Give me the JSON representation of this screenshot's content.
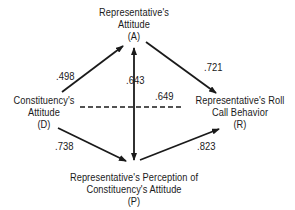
{
  "diagram": {
    "type": "path-diagram",
    "nodes": {
      "A": {
        "line1": "Representative's",
        "line2": "Attitude",
        "line3": "(A)"
      },
      "D": {
        "line1": "Constituency's",
        "line2": "Attitude",
        "line3": "(D)"
      },
      "R": {
        "line1": "Representative's Roll",
        "line2": "Call Behavior",
        "line3": "(R)"
      },
      "P": {
        "line1": "Representative's Perception of",
        "line2": "Constituency's Attitude",
        "line3": "(P)"
      }
    },
    "edges": [
      {
        "from": "D",
        "to": "A",
        "style": "solid",
        "directed": true,
        "coefficient": ".498"
      },
      {
        "from": "P",
        "to": "A",
        "style": "solid",
        "directed": "both",
        "coefficient": ".643"
      },
      {
        "from": "A",
        "to": "R",
        "style": "solid",
        "directed": true,
        "coefficient": ".721"
      },
      {
        "from": "D",
        "to": "R",
        "style": "dashed",
        "directed": false,
        "coefficient": ".649"
      },
      {
        "from": "D",
        "to": "P",
        "style": "solid",
        "directed": true,
        "coefficient": ".738"
      },
      {
        "from": "P",
        "to": "R",
        "style": "solid",
        "directed": true,
        "coefficient": ".823"
      }
    ],
    "colors": {
      "line": "#1a1a1a",
      "text": "#1a1a1a",
      "background": "#ffffff"
    }
  }
}
